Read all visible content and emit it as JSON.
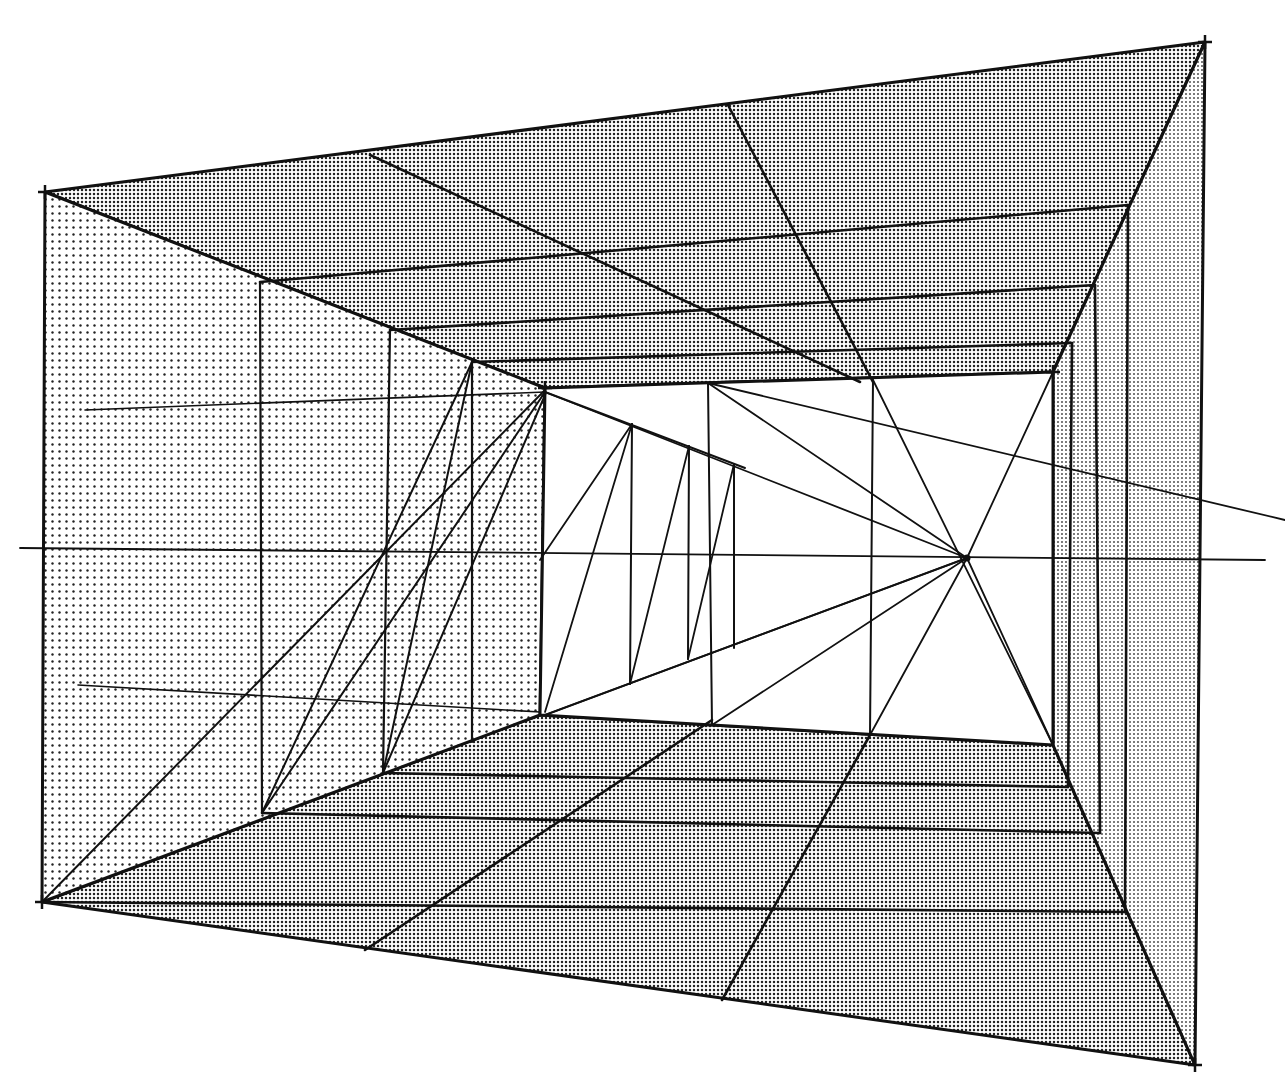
{
  "figure": {
    "type": "perspective-diagram",
    "colors": {
      "ink": "#111111",
      "paper": "#ffffff",
      "ceiling_floor_tone": "#a8a8a8",
      "left_wall_tone": "#d0d0d0",
      "right_wall_tone": "#c4c4c4"
    },
    "vanishing_point": [
      967,
      558
    ],
    "horizon_line": {
      "from": [
        20,
        548
      ],
      "to": [
        1265,
        560
      ]
    },
    "outer_frame": {
      "top_left": [
        45,
        192
      ],
      "top_right": [
        1205,
        42
      ],
      "bottom_right": [
        1195,
        1065
      ],
      "bottom_left": [
        42,
        902
      ]
    },
    "back_wall": {
      "top_left": [
        545,
        388
      ],
      "top_right": [
        1053,
        372
      ],
      "bottom_right": [
        1053,
        745
      ],
      "bottom_left": [
        540,
        715
      ]
    },
    "planes": [
      {
        "name": "ceiling",
        "points": [
          [
            45,
            192
          ],
          [
            1205,
            42
          ],
          [
            1053,
            372
          ],
          [
            545,
            388
          ]
        ],
        "tone": "ceiling_floor_tone"
      },
      {
        "name": "floor",
        "points": [
          [
            540,
            715
          ],
          [
            1053,
            745
          ],
          [
            1195,
            1065
          ],
          [
            42,
            902
          ]
        ],
        "tone": "ceiling_floor_tone"
      },
      {
        "name": "left-wall",
        "points": [
          [
            45,
            192
          ],
          [
            545,
            388
          ],
          [
            540,
            715
          ],
          [
            42,
            902
          ]
        ],
        "tone": "left_wall_tone"
      },
      {
        "name": "right-wall",
        "points": [
          [
            1053,
            372
          ],
          [
            1205,
            42
          ],
          [
            1195,
            1065
          ],
          [
            1053,
            745
          ]
        ],
        "tone": "right_wall_tone"
      }
    ],
    "lines": {
      "ceiling_transversals": [
        [
          [
            260,
            282
          ],
          [
            1128,
            205
          ]
        ],
        [
          [
            390,
            330
          ],
          [
            1095,
            285
          ]
        ],
        [
          [
            472,
            362
          ],
          [
            1072,
            343
          ]
        ]
      ],
      "ceiling_diagonal": [
        [
          370,
          155
        ],
        [
          860,
          382
        ]
      ],
      "ceiling_diagonal_2": [
        [
          728,
          105
        ],
        [
          873,
          382
        ]
      ],
      "floor_transversals": [
        [
          [
            383,
            773
          ],
          [
            1068,
            787
          ]
        ],
        [
          [
            262,
            813
          ],
          [
            1100,
            833
          ]
        ],
        [
          [
            42,
            902
          ],
          [
            1125,
            912
          ]
        ]
      ],
      "floor_diagonal": [
        [
          365,
          950
        ],
        [
          712,
          720
        ]
      ],
      "floor_diagonal_2": [
        [
          722,
          1000
        ],
        [
          870,
          735
        ]
      ],
      "left_wall_verticals": [
        [
          [
            260,
            282
          ],
          [
            262,
            813
          ]
        ],
        [
          [
            390,
            330
          ],
          [
            383,
            773
          ]
        ],
        [
          [
            472,
            362
          ],
          [
            472,
            742
          ]
        ]
      ],
      "left_wall_guides": [
        [
          [
            85,
            410
          ],
          [
            545,
            392
          ]
        ],
        [
          [
            78,
            685
          ],
          [
            540,
            712
          ]
        ]
      ],
      "left_wall_diagonals": [
        [
          [
            42,
            902
          ],
          [
            545,
            390
          ]
        ],
        [
          [
            262,
            813
          ],
          [
            545,
            392
          ]
        ],
        [
          [
            383,
            773
          ],
          [
            545,
            395
          ]
        ],
        [
          [
            383,
            773
          ],
          [
            472,
            362
          ]
        ],
        [
          [
            262,
            813
          ],
          [
            472,
            362
          ]
        ]
      ],
      "right_wall_verticals": [
        [
          [
            1072,
            343
          ],
          [
            1068,
            787
          ]
        ],
        [
          [
            1095,
            285
          ],
          [
            1100,
            833
          ]
        ],
        [
          [
            1128,
            205
          ],
          [
            1125,
            912
          ]
        ]
      ],
      "back_wall_verticals": [
        [
          [
            708,
            383
          ],
          [
            712,
            725
          ]
        ],
        [
          [
            873,
            380
          ],
          [
            870,
            735
          ]
        ]
      ],
      "back_wall_fan_lines": [
        [
          [
            545,
            392
          ],
          [
            967,
            558
          ]
        ],
        [
          [
            708,
            383
          ],
          [
            967,
            558
          ]
        ],
        [
          [
            545,
            715
          ],
          [
            967,
            558
          ]
        ],
        [
          [
            712,
            725
          ],
          [
            967,
            558
          ]
        ],
        [
          [
            870,
            735
          ],
          [
            967,
            558
          ]
        ],
        [
          [
            1053,
            372
          ],
          [
            967,
            558
          ]
        ],
        [
          [
            1053,
            745
          ],
          [
            967,
            558
          ]
        ],
        [
          [
            873,
            380
          ],
          [
            1053,
            745
          ]
        ],
        [
          [
            708,
            383
          ],
          [
            1285,
            520
          ]
        ]
      ],
      "back_wall_receding_frame": {
        "top_edge": [
          [
            545,
            392
          ],
          [
            745,
            468
          ]
        ],
        "posts": [
          [
            [
              632,
              424
            ],
            [
              630,
              684
            ]
          ],
          [
            [
              689,
              446
            ],
            [
              688,
              659
            ]
          ],
          [
            [
              734,
              464
            ],
            [
              734,
              648
            ]
          ]
        ],
        "bottom_edge": [
          [
            545,
            715
          ],
          [
            967,
            558
          ]
        ],
        "diagonals": [
          [
            [
              545,
              712
            ],
            [
              632,
              424
            ]
          ],
          [
            [
              630,
              684
            ],
            [
              689,
              446
            ]
          ],
          [
            [
              688,
              659
            ],
            [
              734,
              464
            ]
          ],
          [
            [
              540,
              560
            ],
            [
              632,
              424
            ]
          ]
        ]
      }
    },
    "corner_marks": [
      [
        45,
        192
      ],
      [
        1205,
        42
      ],
      [
        1195,
        1065
      ],
      [
        42,
        902
      ],
      [
        545,
        388
      ],
      [
        1053,
        372
      ]
    ]
  }
}
